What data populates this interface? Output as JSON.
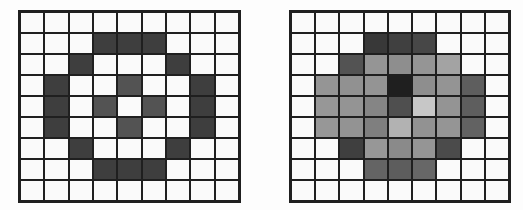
{
  "palette": {
    "W": "#fafafa",
    "D": "#3e3e3e",
    "M": "#535353",
    "line": "#1f1f1f",
    "background": "#fdfdfd"
  },
  "grids": [
    {
      "name": "original-binary-circle",
      "rows": 9,
      "cols": 9,
      "cells": [
        [
          "W",
          "W",
          "W",
          "W",
          "W",
          "W",
          "W",
          "W",
          "W"
        ],
        [
          "W",
          "W",
          "W",
          "D",
          "D",
          "D",
          "W",
          "W",
          "W"
        ],
        [
          "W",
          "W",
          "D",
          "W",
          "W",
          "W",
          "D",
          "W",
          "W"
        ],
        [
          "W",
          "D",
          "W",
          "W",
          "M",
          "W",
          "W",
          "D",
          "W"
        ],
        [
          "W",
          "D",
          "W",
          "M",
          "W",
          "M",
          "W",
          "D",
          "W"
        ],
        [
          "W",
          "D",
          "W",
          "W",
          "M",
          "W",
          "W",
          "D",
          "W"
        ],
        [
          "W",
          "W",
          "D",
          "W",
          "W",
          "W",
          "D",
          "W",
          "W"
        ],
        [
          "W",
          "W",
          "W",
          "D",
          "D",
          "D",
          "W",
          "W",
          "W"
        ],
        [
          "W",
          "W",
          "W",
          "W",
          "W",
          "W",
          "W",
          "W",
          "W"
        ]
      ]
    },
    {
      "name": "smoothed-grayscale-circle",
      "rows": 9,
      "cols": 9,
      "cells": [
        [
          "W",
          "W",
          "W",
          "W",
          "W",
          "W",
          "W",
          "W",
          "W"
        ],
        [
          "W",
          "W",
          "W",
          "#383838",
          "#404040",
          "#474747",
          "W",
          "W",
          "W"
        ],
        [
          "W",
          "W",
          "#535353",
          "#959595",
          "#8e8e8e",
          "#959595",
          "#a3a3a3",
          "W",
          "W"
        ],
        [
          "W",
          "#959595",
          "#919191",
          "#949494",
          "#1f1f1f",
          "#8e8e8e",
          "#949494",
          "#5e5e5e",
          "W"
        ],
        [
          "W",
          "#979797",
          "#949494",
          "#858585",
          "#4f4f4f",
          "#c7c7c7",
          "#949494",
          "#5e5e5e",
          "W"
        ],
        [
          "W",
          "#979797",
          "#939393",
          "#7f7f7f",
          "#b2b2b2",
          "#929292",
          "#959595",
          "#626262",
          "W"
        ],
        [
          "W",
          "W",
          "#3f3f3f",
          "#979797",
          "#8a8a8a",
          "#959595",
          "#4b4b4b",
          "W",
          "W"
        ],
        [
          "W",
          "W",
          "W",
          "#646464",
          "#5d5d5d",
          "#676767",
          "W",
          "W",
          "W"
        ],
        [
          "W",
          "W",
          "W",
          "W",
          "W",
          "W",
          "W",
          "W",
          "W"
        ]
      ]
    }
  ]
}
